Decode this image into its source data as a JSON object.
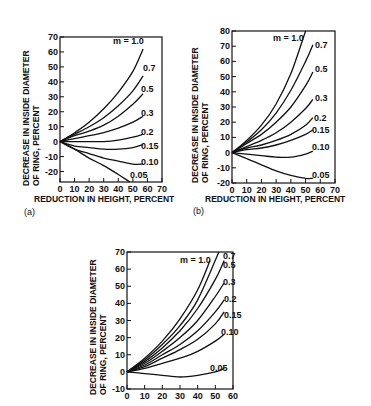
{
  "chart_data": [
    {
      "panel": "(a)",
      "type": "line",
      "title": "",
      "xlabel": "REDUCTION IN HEIGHT, PERCENT",
      "ylabel_line1": "DECREASE IN INSIDE DIAMETER",
      "ylabel_line2": "OF RING, PERCENT",
      "xlim": [
        0,
        70
      ],
      "ylim": [
        -27,
        70
      ],
      "xticks": [
        0,
        10,
        20,
        30,
        40,
        50,
        60,
        70
      ],
      "yticks": [
        70,
        60,
        50,
        40,
        30,
        20,
        10,
        0,
        -10,
        -20
      ],
      "legend_prefix": "m = ",
      "series": [
        {
          "name": "1.0",
          "x": [
            0,
            10,
            20,
            30,
            40,
            50,
            57
          ],
          "y": [
            0,
            6,
            13,
            22,
            33,
            47,
            62
          ]
        },
        {
          "name": "0.7",
          "x": [
            0,
            10,
            20,
            30,
            40,
            50,
            57
          ],
          "y": [
            0,
            5,
            10,
            16,
            24,
            34,
            44
          ]
        },
        {
          "name": "0.5",
          "x": [
            0,
            10,
            20,
            30,
            40,
            50,
            57
          ],
          "y": [
            0,
            4,
            7,
            11,
            17,
            25,
            32
          ]
        },
        {
          "name": "0.3",
          "x": [
            0,
            10,
            20,
            30,
            40,
            50,
            57
          ],
          "y": [
            0,
            2,
            4,
            6,
            9,
            13,
            17
          ]
        },
        {
          "name": "0.2",
          "x": [
            0,
            10,
            20,
            30,
            40,
            50,
            57
          ],
          "y": [
            0,
            0,
            0,
            0,
            1,
            3,
            5
          ]
        },
        {
          "name": "0.15",
          "x": [
            0,
            10,
            20,
            30,
            40,
            50,
            57
          ],
          "y": [
            0,
            -3,
            -4,
            -5,
            -5,
            -4,
            -2
          ]
        },
        {
          "name": "0.10",
          "x": [
            0,
            10,
            20,
            30,
            40,
            50,
            57
          ],
          "y": [
            0,
            -5,
            -8,
            -11,
            -13,
            -15,
            -15
          ]
        },
        {
          "name": "0.05",
          "x": [
            0,
            10,
            20,
            30,
            40,
            48
          ],
          "y": [
            0,
            -5,
            -11,
            -16,
            -22,
            -27
          ]
        }
      ]
    },
    {
      "panel": "(b)",
      "type": "line",
      "title": "",
      "xlabel": "REDUCTION IN HEIGHT, PERCENT",
      "ylabel_line1": "DECREASE IN INSIDE DIAMETER",
      "ylabel_line2": "OF RING, PERCENT",
      "xlim": [
        0,
        70
      ],
      "ylim": [
        -20,
        80
      ],
      "xticks": [
        0,
        10,
        20,
        30,
        40,
        50,
        60,
        70
      ],
      "yticks": [
        80,
        70,
        60,
        50,
        40,
        30,
        20,
        10,
        0,
        -10,
        -20
      ],
      "legend_prefix": "m = ",
      "series": [
        {
          "name": "1.0",
          "x": [
            0,
            10,
            20,
            30,
            40,
            50
          ],
          "y": [
            0,
            8,
            18,
            32,
            52,
            80
          ]
        },
        {
          "name": "0.7",
          "x": [
            0,
            10,
            20,
            30,
            40,
            50,
            55
          ],
          "y": [
            0,
            7,
            15,
            26,
            41,
            60,
            71
          ]
        },
        {
          "name": "0.5",
          "x": [
            0,
            10,
            20,
            30,
            40,
            50,
            55
          ],
          "y": [
            0,
            6,
            12,
            20,
            30,
            44,
            53
          ]
        },
        {
          "name": "0.3",
          "x": [
            0,
            10,
            20,
            30,
            40,
            50,
            55
          ],
          "y": [
            0,
            4,
            8,
            13,
            20,
            29,
            35
          ]
        },
        {
          "name": "0.2",
          "x": [
            0,
            10,
            20,
            30,
            40,
            50,
            55
          ],
          "y": [
            0,
            3,
            5,
            8,
            12,
            18,
            23
          ]
        },
        {
          "name": "0.15",
          "x": [
            0,
            10,
            20,
            30,
            40,
            50,
            55
          ],
          "y": [
            0,
            2,
            3,
            5,
            8,
            12,
            15
          ]
        },
        {
          "name": "0.10",
          "x": [
            0,
            10,
            20,
            30,
            40,
            50,
            55
          ],
          "y": [
            0,
            -1,
            -2,
            -3,
            -3,
            -1,
            1
          ]
        },
        {
          "name": "0.05",
          "x": [
            0,
            10,
            20,
            30,
            40,
            50,
            55
          ],
          "y": [
            0,
            -4,
            -8,
            -12,
            -15,
            -17,
            -17
          ]
        }
      ]
    },
    {
      "panel": "(c)",
      "type": "line",
      "title": "",
      "xlabel": "",
      "ylabel_line1": "DECREASE IN INSIDE DIAMETER",
      "ylabel_line2": "OF RING, PERCENT",
      "xlim": [
        0,
        60
      ],
      "ylim": [
        -10,
        70
      ],
      "xticks": [
        0,
        10,
        20,
        30,
        40,
        50,
        60
      ],
      "yticks": [
        70,
        60,
        50,
        40,
        30,
        20,
        10,
        0,
        -10
      ],
      "legend_prefix": "m = ",
      "series": [
        {
          "name": "1.0",
          "x": [
            0,
            10,
            20,
            30,
            40,
            47
          ],
          "y": [
            0,
            8,
            18,
            31,
            48,
            65
          ]
        },
        {
          "name": "0.7",
          "x": [
            0,
            10,
            20,
            30,
            40,
            52
          ],
          "y": [
            0,
            7,
            16,
            27,
            42,
            70
          ]
        },
        {
          "name": "0.5",
          "x": [
            0,
            10,
            20,
            30,
            40,
            50,
            55
          ],
          "y": [
            0,
            6,
            14,
            24,
            37,
            54,
            65
          ]
        },
        {
          "name": "0.3",
          "x": [
            0,
            10,
            20,
            30,
            40,
            50,
            55
          ],
          "y": [
            0,
            5,
            12,
            20,
            30,
            44,
            52
          ]
        },
        {
          "name": "0.2",
          "x": [
            0,
            10,
            20,
            30,
            40,
            50,
            55
          ],
          "y": [
            0,
            4,
            10,
            16,
            24,
            35,
            42
          ]
        },
        {
          "name": "0.15",
          "x": [
            0,
            10,
            20,
            30,
            40,
            50,
            55
          ],
          "y": [
            0,
            3,
            8,
            13,
            19,
            28,
            35
          ]
        },
        {
          "name": "0.10",
          "x": [
            0,
            10,
            20,
            30,
            40,
            50,
            55
          ],
          "y": [
            0,
            2,
            5,
            8,
            12,
            18,
            22
          ]
        },
        {
          "name": "0.05",
          "x": [
            0,
            10,
            20,
            30,
            40,
            50,
            55
          ],
          "y": [
            0,
            -1,
            -2,
            -3,
            -2,
            0,
            2
          ]
        }
      ]
    }
  ],
  "panels": {
    "a": {
      "label": "(a)"
    },
    "b": {
      "label": "(b)"
    }
  },
  "labels": {
    "ylabel_line1": "DECREASE IN INSIDE DIAMETER",
    "ylabel_line2": "OF RING, PERCENT",
    "xlabel": "REDUCTION IN HEIGHT, PERCENT"
  }
}
